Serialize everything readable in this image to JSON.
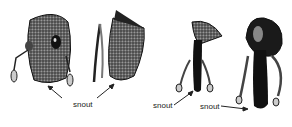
{
  "figure": {
    "labels": [
      "snout",
      "snout",
      "snout"
    ],
    "colors": {
      "ink": "#111111",
      "shade": "#555555",
      "background": "#ffffff"
    },
    "specimens": [
      {
        "name": "head-1",
        "snout": "short"
      },
      {
        "name": "head-2",
        "snout": "short"
      },
      {
        "name": "head-3",
        "snout": "long"
      },
      {
        "name": "head-4",
        "snout": "long"
      }
    ]
  }
}
